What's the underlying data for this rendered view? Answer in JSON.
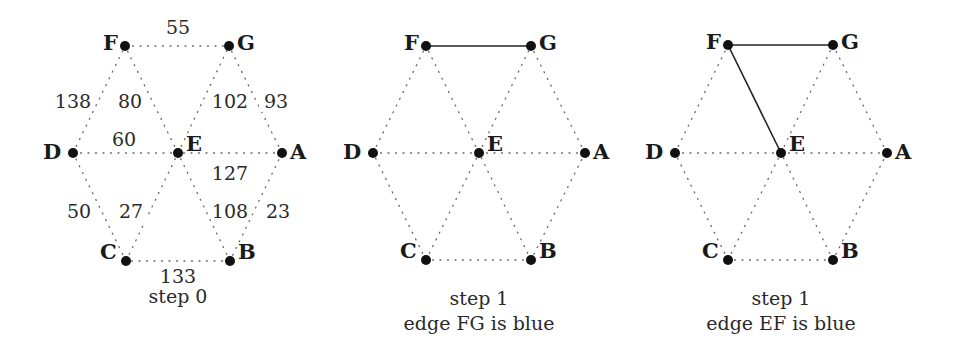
{
  "colors": {
    "node": "#111111",
    "dotted_edge": "#666666",
    "solid_edge": "#222222",
    "text": "#222222"
  },
  "weights": [
    {
      "edge": "FG",
      "label": "55",
      "x": 178,
      "y": 34
    },
    {
      "edge": "DF",
      "label": "138",
      "x": 73,
      "y": 108
    },
    {
      "edge": "EF",
      "label": "80",
      "x": 130,
      "y": 108
    },
    {
      "edge": "EG",
      "label": "102",
      "x": 230,
      "y": 108
    },
    {
      "edge": "AG",
      "label": "93",
      "x": 276,
      "y": 108
    },
    {
      "edge": "DE",
      "label": "60",
      "x": 124,
      "y": 146
    },
    {
      "edge": "AE",
      "label": "127",
      "x": 230,
      "y": 180
    },
    {
      "edge": "CD",
      "label": "50",
      "x": 79,
      "y": 218
    },
    {
      "edge": "CE",
      "label": "27",
      "x": 131,
      "y": 218
    },
    {
      "edge": "BE",
      "label": "108",
      "x": 230,
      "y": 218
    },
    {
      "edge": "AB",
      "label": "23",
      "x": 278,
      "y": 218
    },
    {
      "edge": "BC",
      "label": "133",
      "x": 178,
      "y": 283
    }
  ],
  "panels": [
    {
      "id": "step0",
      "caption_lines": [
        "step 0"
      ],
      "caption_x": 178,
      "caption_y": [
        303
      ],
      "show_weights": true,
      "nodes": {
        "F": {
          "x": 125,
          "y": 46
        },
        "G": {
          "x": 229,
          "y": 46
        },
        "D": {
          "x": 73,
          "y": 153
        },
        "E": {
          "x": 178,
          "y": 153
        },
        "A": {
          "x": 282,
          "y": 153
        },
        "C": {
          "x": 126,
          "y": 261
        },
        "B": {
          "x": 230,
          "y": 261
        }
      },
      "solid_edges": []
    },
    {
      "id": "step1-fg",
      "caption_lines": [
        "step 1",
        "edge FG is blue"
      ],
      "caption_x": 479,
      "caption_y": [
        305,
        330
      ],
      "show_weights": false,
      "nodes": {
        "F": {
          "x": 426,
          "y": 46
        },
        "G": {
          "x": 531,
          "y": 46
        },
        "D": {
          "x": 373,
          "y": 153
        },
        "E": {
          "x": 479,
          "y": 153
        },
        "A": {
          "x": 585,
          "y": 153
        },
        "C": {
          "x": 426,
          "y": 260
        },
        "B": {
          "x": 531,
          "y": 260
        }
      },
      "solid_edges": [
        "FG"
      ]
    },
    {
      "id": "step1-ef",
      "caption_lines": [
        "step 1",
        "edge EF is blue"
      ],
      "caption_x": 781,
      "caption_y": [
        305,
        330
      ],
      "show_weights": false,
      "nodes": {
        "F": {
          "x": 728,
          "y": 45
        },
        "G": {
          "x": 833,
          "y": 45
        },
        "D": {
          "x": 675,
          "y": 153
        },
        "E": {
          "x": 781,
          "y": 153
        },
        "A": {
          "x": 887,
          "y": 153
        },
        "C": {
          "x": 728,
          "y": 260
        },
        "B": {
          "x": 833,
          "y": 260
        }
      },
      "solid_edges": [
        "FG",
        "EF"
      ]
    }
  ],
  "edges": [
    "FG",
    "DF",
    "EF",
    "EG",
    "AG",
    "DE",
    "AE",
    "CD",
    "CE",
    "BE",
    "AB",
    "BC"
  ],
  "label_offsets": {
    "F": {
      "dx": -22,
      "dy": 4,
      "anchor": "start"
    },
    "G": {
      "dx": 8,
      "dy": 4,
      "anchor": "start"
    },
    "D": {
      "dx": -30,
      "dy": 6,
      "anchor": "start"
    },
    "E": {
      "dx": 8,
      "dy": -2,
      "anchor": "start"
    },
    "A": {
      "dx": 8,
      "dy": 6,
      "anchor": "start"
    },
    "C": {
      "dx": -26,
      "dy": -2,
      "anchor": "start"
    },
    "B": {
      "dx": 8,
      "dy": -2,
      "anchor": "start"
    }
  }
}
